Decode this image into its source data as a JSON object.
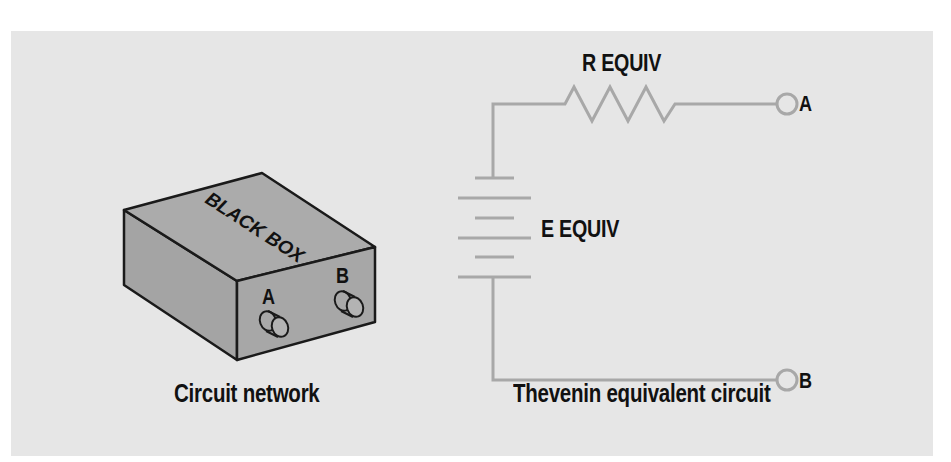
{
  "figure": {
    "background_color": "#e6e6e6",
    "wire_color": "#a8a8a8",
    "box_fill": "#a9a9a9",
    "box_outline": "#1a1a1a"
  },
  "left_diagram": {
    "box_label": "BLACK BOX",
    "terminals": [
      {
        "label": "A"
      },
      {
        "label": "B"
      }
    ],
    "caption": "Circuit network"
  },
  "right_diagram": {
    "resistor_label": "R EQUIV",
    "source_label": "E EQUIV",
    "terminals": [
      {
        "label": "A"
      },
      {
        "label": "B"
      }
    ],
    "caption": "Thevenin equivalent circuit"
  }
}
